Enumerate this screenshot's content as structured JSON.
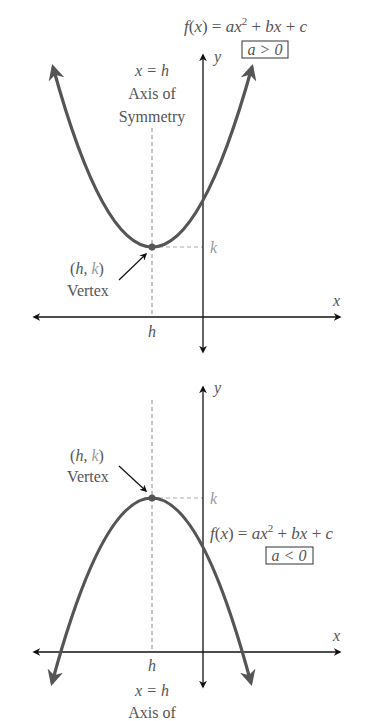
{
  "top": {
    "equation": "f(x) = ax² + bx + c",
    "condition": "a > 0",
    "axis_eq": "x = h",
    "axis_label_1": "Axis of",
    "axis_label_2": "Symmetry",
    "vertex_coord": "(h, k)",
    "vertex_label": "Vertex",
    "k_label": "k",
    "h_label": "h",
    "x_label": "x",
    "y_label": "y"
  },
  "bottom": {
    "equation": "f(x) = ax² + bx + c",
    "condition": "a < 0",
    "axis_eq": "x = h",
    "axis_label_1": "Axis of",
    "vertex_coord": "(h, k)",
    "vertex_label": "Vertex",
    "k_label": "k",
    "h_label": "h",
    "x_label": "x",
    "y_label": "y"
  },
  "colors": {
    "curve": "#555555",
    "axis": "#111111",
    "dashed": "#9a9a9a",
    "text": "#555555"
  }
}
